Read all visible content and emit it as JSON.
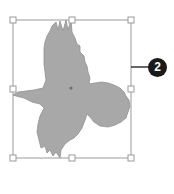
{
  "selection": {
    "box": {
      "x": 13,
      "y": 20,
      "width": 118,
      "height": 138
    },
    "stroke_color": "#9a9a9a",
    "handle_fill": "#ffffff"
  },
  "shape": {
    "name": "bird-silhouette",
    "fill_color": "#a8a8a8",
    "outline_color": "#909090",
    "center_dot_color": "#6e6e6e"
  },
  "callout": {
    "number": "2",
    "badge_color": "#1a1a1a",
    "line_color": "#333333"
  }
}
